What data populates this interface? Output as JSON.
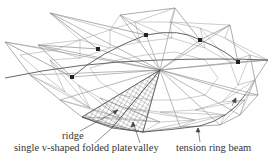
{
  "diagram": {
    "colors": {
      "line": "#8a8a8a",
      "dark_line": "#555555",
      "node": "#222222",
      "hatch": "#666666",
      "label": "#333333"
    },
    "labels": {
      "ridge": "ridge",
      "plate": "single v-shaped folded plate",
      "valley": "valley",
      "ring_beam": "tension ring beam"
    }
  }
}
